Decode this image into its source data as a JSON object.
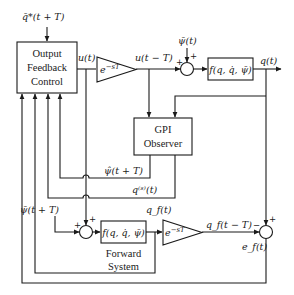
{
  "diagram": {
    "colors": {
      "stroke": "#1a1a1a",
      "background": "#ffffff"
    },
    "blocks": {
      "controller": {
        "lines": [
          "Output",
          "Feedback",
          "Control"
        ]
      },
      "delay_top": {
        "label": "e^{-sT}",
        "base": "e",
        "exp": "−sT"
      },
      "plant": {
        "label": "f(q, q̇, ψ̄)"
      },
      "observer": {
        "lines": [
          "GPI",
          "Observer"
        ]
      },
      "forward_model": {
        "label": "f(q, q̇, ψ̄)"
      },
      "forward_caption": {
        "lines": [
          "Forward",
          "System"
        ]
      },
      "delay_bottom": {
        "label": "e^{-sT}",
        "base": "e",
        "exp": "−sT"
      }
    },
    "signals": {
      "reference": "q̄*(t + T)",
      "control": "u(t)",
      "delayed_control": "u(t − T)",
      "disturbance": "ψ̄(t)",
      "output": "q(t)",
      "disturbance_estimate": "ψ̂(t + T)",
      "output_derivatives": "q⁽ˢ⁾(t)",
      "predicted_disturbance": "ψ̄(t + T)",
      "forward_output": "q_f(t)",
      "forward_delayed": "q_f(t − T)",
      "forward_error": "e_f(t)"
    },
    "summing_junctions": {
      "plant_input": {
        "signs": [
          "+",
          "+"
        ]
      },
      "forward_input": {
        "signs": [
          "+",
          "+"
        ]
      },
      "error": {
        "signs": [
          "+",
          "−"
        ]
      }
    }
  }
}
